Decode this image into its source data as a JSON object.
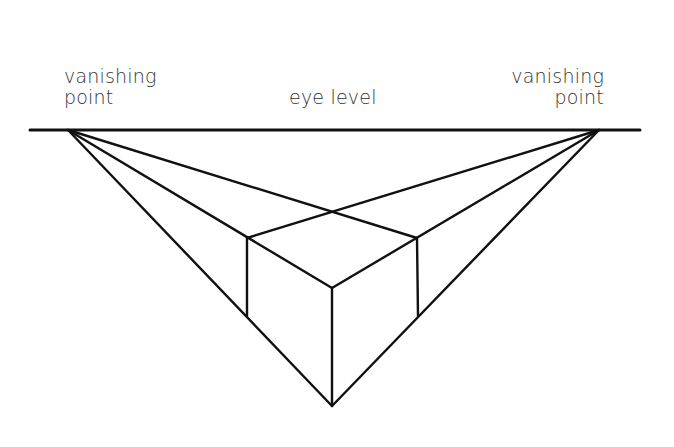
{
  "diagram": {
    "labels": {
      "left_vanishing_point": {
        "line1": "vanishing",
        "line2": "point"
      },
      "right_vanishing_point": {
        "line1": "vanishing",
        "line2": "point"
      },
      "horizon": "eye level"
    },
    "points": {
      "left_vp": [
        68,
        130
      ],
      "right_vp": [
        599,
        130
      ],
      "crossing": [
        333,
        211
      ],
      "cube_top_left": [
        247,
        238
      ],
      "cube_top_right": [
        417,
        238
      ],
      "cube_top_front": [
        332,
        288
      ],
      "cube_bottom_left": [
        247,
        316
      ],
      "cube_bottom_right": [
        418,
        316
      ],
      "cube_bottom_front": [
        332,
        406
      ]
    },
    "horizon_line": {
      "x1": 30,
      "x2": 640,
      "y": 130
    },
    "colors": {
      "line": "#111111",
      "text": "#333333",
      "background": "#ffffff"
    }
  }
}
